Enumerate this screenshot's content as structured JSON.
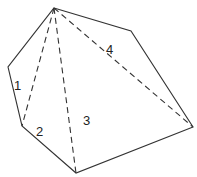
{
  "diagram": {
    "type": "polygon-triangulation",
    "colors": {
      "line": "#333333",
      "text": "#222222",
      "background": "#ffffff"
    },
    "vertices": [
      {
        "id": "A",
        "x": 54,
        "y": 8
      },
      {
        "id": "B",
        "x": 131,
        "y": 31
      },
      {
        "id": "C",
        "x": 193,
        "y": 127
      },
      {
        "id": "D",
        "x": 76,
        "y": 173
      },
      {
        "id": "E",
        "x": 22,
        "y": 126
      },
      {
        "id": "F",
        "x": 8,
        "y": 67
      }
    ],
    "diagonals": [
      {
        "from": "A",
        "to": "E"
      },
      {
        "from": "A",
        "to": "D"
      },
      {
        "from": "A",
        "to": "C"
      }
    ],
    "labels": [
      {
        "text": "1",
        "x": 14,
        "y": 90
      },
      {
        "text": "2",
        "x": 36,
        "y": 136
      },
      {
        "text": "3",
        "x": 83,
        "y": 125
      },
      {
        "text": "4",
        "x": 106,
        "y": 54
      }
    ]
  }
}
